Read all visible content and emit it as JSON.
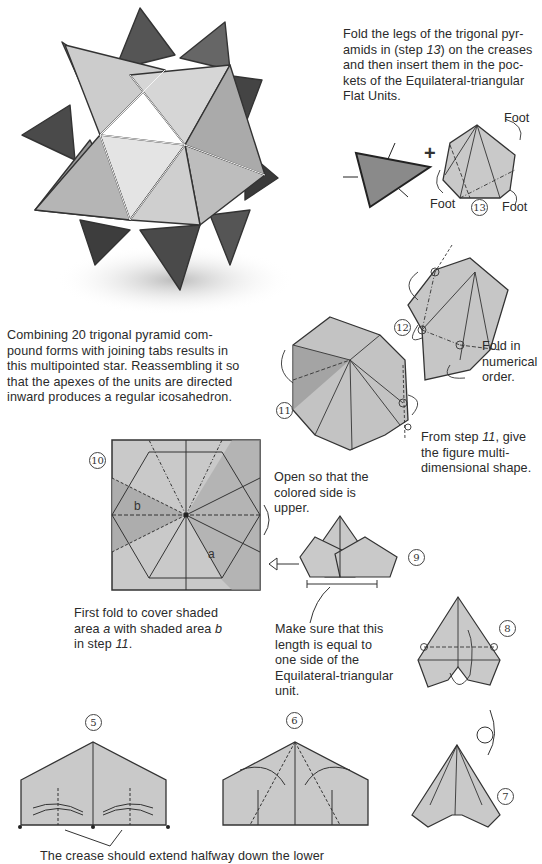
{
  "page": {
    "colors": {
      "paper_fill": "#c9c9c9",
      "paper_shaded": "#a9a9a9",
      "line": "#333333",
      "text": "#2a2a2a"
    },
    "illustration": {
      "name": "multipointed-star-drawing",
      "description": "pencil drawing of a 20-unit multipointed star"
    },
    "captions": {
      "top_right": {
        "line1": "Fold the legs of the trigonal pyr-",
        "line2a": "amids in (step ",
        "line2b": "13",
        "line2c": ") on the creases",
        "line3": "and then insert them in the poc-",
        "line4": "kets of the Equilateral-triangular",
        "line5": "Flat Units."
      },
      "star_description": [
        "Combining 20 trigonal pyramid com-",
        "pound forms with joining tabs results in",
        "this multipointed star. Reassembling it so",
        "that the apexes of the units are directed",
        "inward produces a regular icosahedron."
      ],
      "fold_numerical": [
        "Fold in",
        "numerical",
        "order."
      ],
      "from_step_11": {
        "a": "From step ",
        "b": "11",
        "c": ", give",
        "line2": "the figure multi-",
        "line3": "dimensional shape."
      },
      "open_colored": [
        "Open so that the",
        "colored side is",
        "upper."
      ],
      "first_fold": {
        "line1": "First fold to cover shaded",
        "l2a": "area ",
        "l2b": "a",
        "l2c": " with shaded area ",
        "l2d": "b",
        "l3a": "in step ",
        "l3b": "11",
        "l3c": "."
      },
      "make_sure": [
        "Make sure that this",
        "length is equal to",
        "one side of the",
        "Equilateral-triangular",
        "unit."
      ],
      "crease_note": "The crease should extend halfway down the lower"
    },
    "step13": {
      "label": "⑬",
      "foot_labels": [
        "Foot",
        "Foot",
        "Foot"
      ],
      "plus": "+"
    },
    "steps": {
      "s5": "5",
      "s6": "6",
      "s7": "7",
      "s8": "8",
      "s9": "9",
      "s10": "10",
      "s11": "11",
      "s12": "12",
      "s13": "13"
    },
    "diagram10": {
      "area_a": "a",
      "area_b": "b"
    }
  }
}
